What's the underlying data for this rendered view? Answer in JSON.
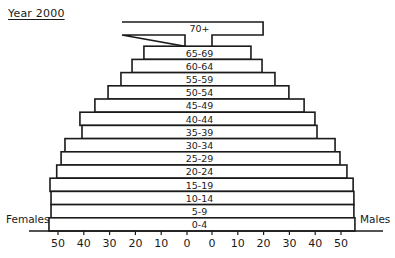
{
  "title": "Year 2000",
  "labels": {
    "left": "Females",
    "right": "Males"
  },
  "chart_data": {
    "type": "bar",
    "subtype": "population-pyramid",
    "title": "Year 2000",
    "xlabel": "",
    "ylabel": "",
    "categories": [
      "0-4",
      "5-9",
      "10-14",
      "15-19",
      "20-24",
      "25-29",
      "30-34",
      "35-39",
      "40-44",
      "45-49",
      "50-54",
      "55-59",
      "60-64",
      "65-69",
      "70+"
    ],
    "series": [
      {
        "name": "Females",
        "side": "left",
        "values": [
          53.5,
          52.7,
          52.7,
          53.1,
          50.5,
          48.8,
          47.3,
          40.7,
          41.5,
          35.7,
          30.6,
          25.6,
          21.3,
          16.7,
          25.2
        ]
      },
      {
        "name": "Males",
        "side": "right",
        "values": [
          55.4,
          55.0,
          55.0,
          54.7,
          52.3,
          49.6,
          47.7,
          40.7,
          39.9,
          35.7,
          29.8,
          24.4,
          19.4,
          15.1,
          19.8
        ]
      }
    ],
    "xticks_left": [
      50,
      40,
      30,
      20,
      10,
      0
    ],
    "xticks_right": [
      0,
      10,
      20,
      30,
      40,
      50
    ],
    "xlim": [
      0,
      55
    ],
    "grid": false,
    "legend": "none (side labels Females left, Males right)"
  }
}
